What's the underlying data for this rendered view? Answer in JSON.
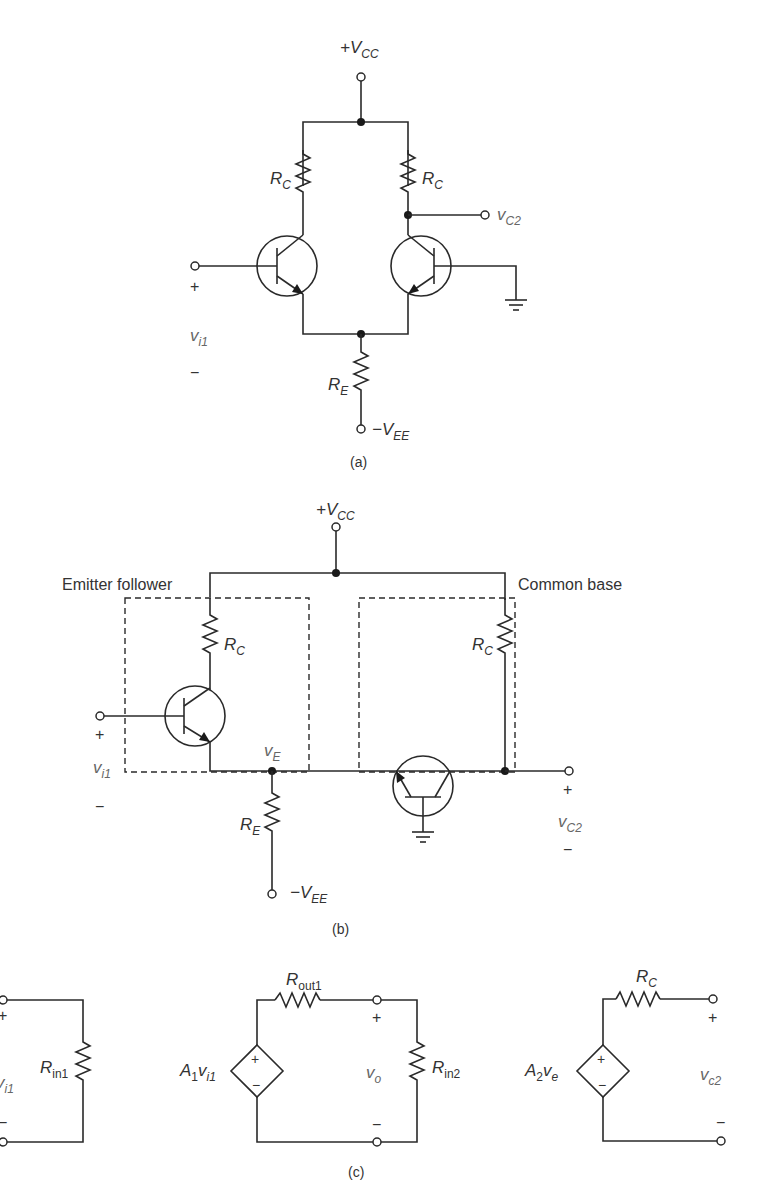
{
  "figure_a": {
    "caption": "(a)",
    "vcc": {
      "prefix": "+V",
      "sub": "CC"
    },
    "vee": {
      "prefix": "−V",
      "sub": "EE"
    },
    "rc_left": {
      "main": "R",
      "sub": "C"
    },
    "rc_right": {
      "main": "R",
      "sub": "C"
    },
    "re": {
      "main": "R",
      "sub": "E"
    },
    "output": {
      "main": "v",
      "sub": "C2"
    },
    "input": {
      "main": "v",
      "sub": "i1",
      "plus": "+",
      "minus": "−"
    }
  },
  "figure_b": {
    "caption": "(b)",
    "vcc": {
      "prefix": "+V",
      "sub": "CC"
    },
    "vee": {
      "prefix": "−V",
      "sub": "EE"
    },
    "block_left_label": "Emitter follower",
    "block_right_label": "Common base",
    "rc_left": {
      "main": "R",
      "sub": "C"
    },
    "rc_right": {
      "main": "R",
      "sub": "C"
    },
    "re": {
      "main": "R",
      "sub": "E"
    },
    "node_ve": {
      "main": "v",
      "sub": "E"
    },
    "input": {
      "main": "v",
      "sub": "i1",
      "plus": "+",
      "minus": "−"
    },
    "output": {
      "main": "v",
      "sub": "C2",
      "plus": "+",
      "minus": "−"
    }
  },
  "figure_c": {
    "caption": "(c)",
    "stage1": {
      "input": {
        "main": "v",
        "sub": "i1",
        "plus": "+",
        "minus": "−"
      },
      "rin": {
        "main": "R",
        "sub": "in1"
      }
    },
    "stage2": {
      "source": {
        "main": "A",
        "sub1": "1",
        "v": "v",
        "sub2": "i1",
        "plus": "+",
        "minus": "−"
      },
      "rout": {
        "main": "R",
        "sub": "out1"
      },
      "vo": {
        "main": "v",
        "sub": "o",
        "plus": "+",
        "minus": "−"
      },
      "rin": {
        "main": "R",
        "sub": "in2"
      }
    },
    "stage3": {
      "source": {
        "main": "A",
        "sub1": "2",
        "v": "v",
        "sub2": "e",
        "plus": "+",
        "minus": "−"
      },
      "rc": {
        "main": "R",
        "sub": "C"
      },
      "out": {
        "main": "v",
        "sub": "c2",
        "plus": "+",
        "minus": "−"
      }
    }
  }
}
